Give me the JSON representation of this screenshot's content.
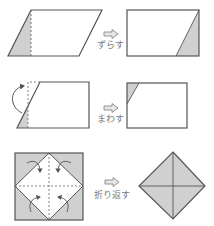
{
  "colors": {
    "stroke": "#555555",
    "shade": "#d0d0d0",
    "arrow_fill": "#e6e6e6",
    "arrow_stroke": "#8a8a8a",
    "label": "#7a7a7a"
  },
  "steps": [
    {
      "label": "ずらす"
    },
    {
      "label": "まわす"
    },
    {
      "label": "折り返す"
    }
  ]
}
